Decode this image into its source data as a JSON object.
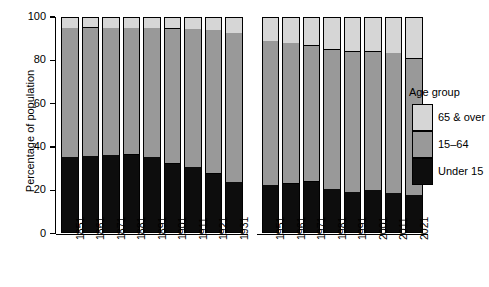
{
  "chart_data": {
    "type": "bar",
    "subtype": "stacked-bar-100-percent",
    "title": "",
    "xlabel": "",
    "ylabel": "Percentage of population",
    "ylim": [
      0,
      100
    ],
    "yticks": [
      0,
      20,
      40,
      60,
      80,
      100
    ],
    "ytick_labels": [
      "0",
      "20",
      "40",
      "60",
      "80",
      "100"
    ],
    "grid": false,
    "legend_position": "right",
    "legend_title": "Age group",
    "categories": [
      "1851",
      "1861",
      "1871",
      "1881",
      "1891",
      "1901",
      "1911",
      "1921",
      "1931",
      "1951",
      "1961",
      "1971",
      "1981",
      "1991",
      "2001",
      "2011",
      "2021"
    ],
    "groups": [
      {
        "name": "group-1851-1931",
        "categories": [
          "1851",
          "1861",
          "1871",
          "1881",
          "1891",
          "1901",
          "1911",
          "1921",
          "1931"
        ]
      },
      {
        "name": "group-1951-2021",
        "categories": [
          "1951",
          "1961",
          "1971",
          "1981",
          "1991",
          "2001",
          "2011",
          "2021"
        ]
      }
    ],
    "series": [
      {
        "name": "Under 15",
        "color": "#0d0d0d",
        "values": [
          35.5,
          36.0,
          36.3,
          36.7,
          35.5,
          32.5,
          30.8,
          27.8,
          23.9,
          22.5,
          23.3,
          24.1,
          20.7,
          19.2,
          20.2,
          18.9,
          17.9
        ]
      },
      {
        "name": "15–64",
        "color": "#999999",
        "values": [
          59.5,
          59.2,
          58.8,
          58.4,
          59.5,
          62.3,
          63.8,
          66.3,
          68.8,
          66.5,
          64.9,
          62.8,
          64.3,
          65.0,
          64.0,
          64.6,
          63.1
        ]
      },
      {
        "name": "65 & over",
        "color": "#d6d6d6",
        "values": [
          5.0,
          4.8,
          4.9,
          4.9,
          5.0,
          5.2,
          5.4,
          5.9,
          7.3,
          11.0,
          11.8,
          13.1,
          15.0,
          15.8,
          15.8,
          16.5,
          19.0
        ]
      }
    ]
  },
  "legend": {
    "title": "Age group",
    "items": [
      {
        "label": "65 & over",
        "color": "#d6d6d6"
      },
      {
        "label": "15–64",
        "color": "#999999"
      },
      {
        "label": "Under 15",
        "color": "#0d0d0d"
      }
    ]
  },
  "axis": {
    "y_title": "Percentage of population"
  }
}
